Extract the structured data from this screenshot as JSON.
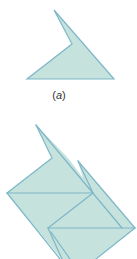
{
  "figure": {
    "caption": {
      "open": "(",
      "letter": "a",
      "close": ")"
    },
    "colors": {
      "fill": "#c6e2dd",
      "stroke": "#7db7c8",
      "background": "#ffffff"
    },
    "shape_a": {
      "description": "Single dart-shaped tile (concave quadrilateral)",
      "points": [
        [
          54,
          10
        ],
        [
          114,
          79
        ],
        [
          27,
          79
        ],
        [
          72,
          44
        ]
      ]
    },
    "tiling": {
      "description": "Several dart tiles fitted together",
      "tiles": [
        {
          "points": [
            [
              36,
              125
            ],
            [
              93,
              193
            ],
            [
              7,
              193
            ],
            [
              52,
              158
            ]
          ]
        },
        {
          "points": [
            [
              7,
              193
            ],
            [
              93,
              193
            ],
            [
              48,
              228
            ],
            [
              62,
              259
            ],
            [
              7,
              193
            ]
          ]
        },
        {
          "points": [
            [
              78,
              161
            ],
            [
              135,
              228
            ],
            [
              48,
              228
            ],
            [
              93,
              193
            ]
          ]
        },
        {
          "points": [
            [
              48,
              228
            ],
            [
              135,
              228
            ],
            [
              96,
              259
            ],
            [
              62,
              259
            ]
          ]
        }
      ]
    }
  }
}
